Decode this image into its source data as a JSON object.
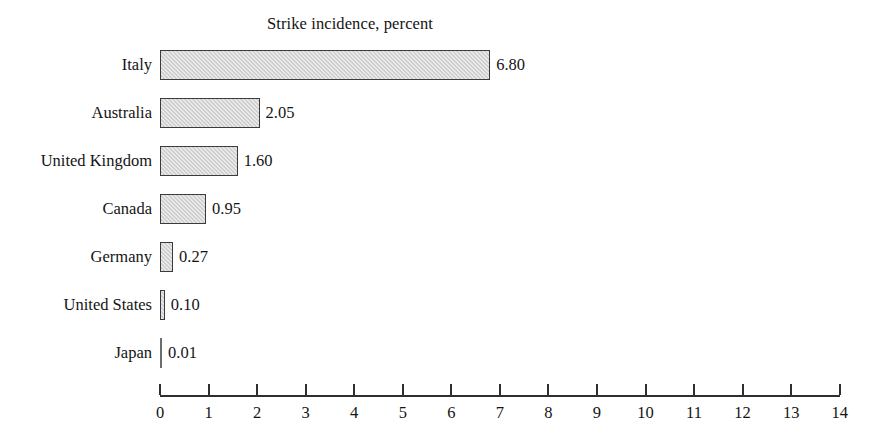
{
  "chart_data": {
    "type": "bar",
    "orientation": "horizontal",
    "title": "Strike incidence, percent",
    "xlabel": "",
    "ylabel": "",
    "categories": [
      "Italy",
      "Australia",
      "United Kingdom",
      "Canada",
      "Germany",
      "United States",
      "Japan"
    ],
    "values": [
      6.8,
      2.05,
      1.6,
      0.95,
      0.27,
      0.1,
      0.01
    ],
    "value_labels": [
      "6.80",
      "2.05",
      "1.60",
      "0.95",
      "0.27",
      "0.10",
      "0.01"
    ],
    "xlim": [
      0,
      14
    ],
    "xticks": [
      0,
      1,
      2,
      3,
      4,
      5,
      6,
      7,
      8,
      9,
      10,
      11,
      12,
      13,
      14
    ],
    "xtick_labels": [
      "0",
      "1",
      "2",
      "3",
      "4",
      "5",
      "6",
      "7",
      "8",
      "9",
      "10",
      "11",
      "12",
      "13",
      "14"
    ],
    "grid": false,
    "legend": false,
    "bar_fill_color": "#d9d9d9",
    "bar_border_color": "#3a3a3a",
    "axis_color": "#2f2f2f",
    "text_color": "#141414",
    "background_color": "#ffffff"
  }
}
